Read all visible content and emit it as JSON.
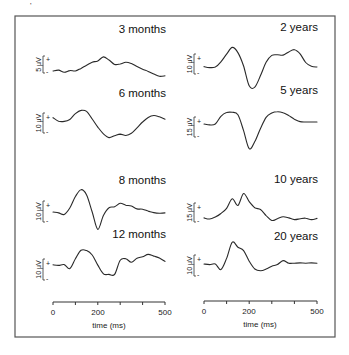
{
  "figure": {
    "corner_mark": "'",
    "x_axis": {
      "ticks": [
        "0",
        "200",
        "500"
      ],
      "label": "time (ms)"
    }
  },
  "chart_data": {
    "type": "line",
    "title": "",
    "xlabel": "time (ms)",
    "ylabel": "",
    "xlim": [
      0,
      500
    ],
    "x_tick_labels": [
      "0",
      "200",
      "500"
    ],
    "x_minor_ticks": [
      0,
      100,
      200,
      300,
      400,
      500
    ],
    "grid": false,
    "layout": "2 columns x 4 rows of stacked waveform panels, shared time axis per column",
    "panels": [
      {
        "label": "3 months",
        "column": 0,
        "scale": "5 μV",
        "polarity_marks": [
          "+",
          "-"
        ],
        "x": [
          0,
          25,
          50,
          75,
          100,
          125,
          150,
          175,
          200,
          225,
          250,
          275,
          300,
          325,
          350,
          375,
          400,
          425,
          450,
          475,
          500
        ],
        "y": [
          0.0,
          0.4,
          -0.6,
          0.2,
          0.0,
          1.2,
          2.6,
          4.0,
          4.6,
          6.4,
          5.0,
          3.0,
          3.2,
          4.0,
          3.4,
          2.0,
          0.8,
          -0.2,
          -1.4,
          -2.4,
          -2.2
        ]
      },
      {
        "label": "6 months",
        "column": 0,
        "scale": "10 μV",
        "polarity_marks": [
          "+",
          "-"
        ],
        "x": [
          0,
          25,
          50,
          75,
          100,
          125,
          150,
          175,
          200,
          225,
          250,
          275,
          300,
          325,
          350,
          375,
          400,
          425,
          450,
          475,
          500
        ],
        "y": [
          1.0,
          -1.6,
          -1.8,
          -0.4,
          4.0,
          6.4,
          5.6,
          0.0,
          -6.0,
          -11.0,
          -13.8,
          -12.4,
          -11.2,
          -12.2,
          -10.6,
          -6.6,
          -2.2,
          1.2,
          2.6,
          1.6,
          -0.2
        ]
      },
      {
        "label": "8 months",
        "column": 0,
        "scale": "10 μV",
        "polarity_marks": [
          "+",
          "-"
        ],
        "x": [
          0,
          25,
          50,
          75,
          100,
          125,
          150,
          175,
          200,
          225,
          250,
          275,
          300,
          325,
          350,
          375,
          400,
          425,
          450,
          475,
          500
        ],
        "y": [
          0.0,
          -0.6,
          -1.6,
          2.6,
          10.0,
          14.4,
          11.0,
          0.0,
          -11.2,
          -2.2,
          2.8,
          3.4,
          5.6,
          4.4,
          3.8,
          2.0,
          1.8,
          0.6,
          -0.4,
          -0.8,
          -0.6
        ]
      },
      {
        "label": "12 months",
        "column": 0,
        "scale": "10 μV",
        "polarity_marks": [
          "+",
          "-"
        ],
        "x": [
          0,
          25,
          50,
          75,
          100,
          125,
          150,
          175,
          200,
          225,
          250,
          275,
          300,
          325,
          350,
          375,
          400,
          425,
          450,
          475,
          500
        ],
        "y": [
          0.8,
          0.4,
          1.0,
          -1.8,
          5.0,
          10.8,
          10.6,
          7.6,
          0.6,
          -5.4,
          -5.8,
          -5.8,
          4.0,
          5.0,
          2.6,
          5.4,
          6.4,
          8.0,
          6.8,
          5.6,
          3.2
        ]
      },
      {
        "label": "2 years",
        "column": 1,
        "scale": "10 μV",
        "polarity_marks": [
          "+",
          "-"
        ],
        "x": [
          0,
          25,
          50,
          75,
          100,
          125,
          150,
          175,
          200,
          225,
          250,
          275,
          300,
          325,
          350,
          375,
          400,
          425,
          450,
          475,
          500
        ],
        "y": [
          -0.4,
          -1.0,
          -0.6,
          2.6,
          7.4,
          11.6,
          8.4,
          0.0,
          -12.4,
          -13.2,
          -6.0,
          2.4,
          6.6,
          7.0,
          6.8,
          8.8,
          10.2,
          7.6,
          2.2,
          -0.2,
          -0.6
        ]
      },
      {
        "label": "5 years",
        "column": 1,
        "scale": "15 μV",
        "polarity_marks": [
          "+",
          "-"
        ],
        "x": [
          0,
          25,
          50,
          75,
          100,
          125,
          150,
          175,
          200,
          225,
          250,
          275,
          300,
          325,
          350,
          375,
          400,
          425,
          450,
          475,
          500
        ],
        "y": [
          0.0,
          -0.8,
          0.0,
          7.0,
          10.4,
          10.6,
          8.4,
          -6.0,
          -22.4,
          -16.0,
          -4.0,
          6.0,
          10.0,
          11.2,
          10.2,
          7.6,
          4.4,
          2.2,
          1.8,
          1.8,
          1.8
        ]
      },
      {
        "label": "10 years",
        "column": 1,
        "scale": "15 μV",
        "polarity_marks": [
          "+",
          "-"
        ],
        "x": [
          0,
          25,
          50,
          75,
          100,
          125,
          150,
          175,
          200,
          225,
          250,
          275,
          300,
          325,
          350,
          375,
          400,
          425,
          450,
          475,
          500
        ],
        "y": [
          -0.6,
          -1.4,
          0.0,
          2.4,
          6.0,
          12.6,
          8.0,
          16.2,
          10.6,
          6.4,
          5.2,
          1.0,
          -2.4,
          -1.2,
          0.2,
          -0.6,
          -1.8,
          -1.2,
          -0.8,
          -1.8,
          -1.0
        ]
      },
      {
        "label": "20 years",
        "column": 1,
        "scale": "10 μV",
        "polarity_marks": [
          "+",
          "-"
        ],
        "x": [
          0,
          25,
          50,
          75,
          100,
          125,
          150,
          175,
          200,
          225,
          250,
          275,
          300,
          325,
          350,
          375,
          400,
          425,
          450,
          475,
          500
        ],
        "y": [
          0.0,
          -0.4,
          0.0,
          -4.0,
          4.0,
          15.6,
          12.0,
          9.6,
          2.0,
          -3.6,
          -4.8,
          -3.6,
          -1.6,
          -0.4,
          2.4,
          0.6,
          0.6,
          0.8,
          0.6,
          0.8,
          0.6
        ]
      }
    ]
  }
}
